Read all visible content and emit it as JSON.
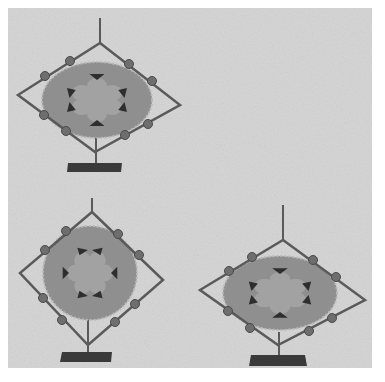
{
  "image": {
    "width": 385,
    "height": 382,
    "description": "Grayscale photo of three ornamental spinning decorations on stands",
    "colors": {
      "page": "#ffffff",
      "backdrop": "#d4d4d4",
      "disc": "#8f8f8f",
      "disc_rim": "#b8b8b8",
      "metal": "#5a5a5a",
      "bead": "#6e6e6e",
      "petal": "#9e9e9e",
      "dark_accent": "#2e2e2e",
      "base": "#3a3a3a"
    }
  },
  "objects": [
    {
      "name": "spinner-top-left",
      "disc_shape": "ellipse",
      "cx": 97,
      "cy": 100,
      "rx": 55,
      "ry": 38
    },
    {
      "name": "spinner-bottom-left",
      "disc_shape": "circle",
      "cx": 90,
      "cy": 273,
      "rx": 47,
      "ry": 47
    },
    {
      "name": "spinner-bottom-right",
      "disc_shape": "ellipse",
      "cx": 280,
      "cy": 293,
      "rx": 57,
      "ry": 37
    }
  ]
}
